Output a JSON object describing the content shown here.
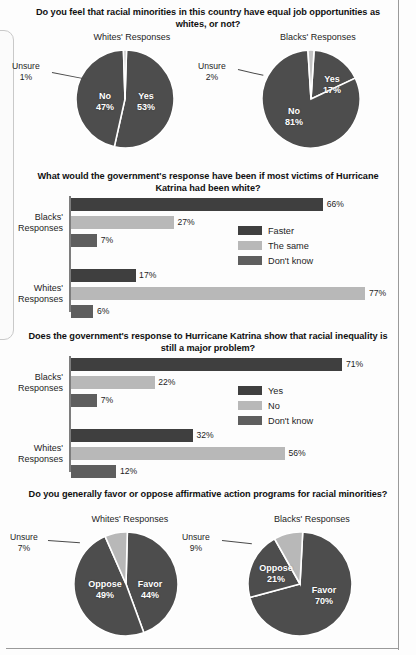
{
  "colors": {
    "dark": "#4d4d4d",
    "darker": "#3f3f3f",
    "medium": "#5e5e5e",
    "light": "#b8b8b8",
    "axis": "#7d7d7d",
    "text": "#1d1d1d",
    "white": "#ffffff"
  },
  "panels": [
    {
      "id": "job-opportunities",
      "title": "Do you feel that racial minorities in this country have equal job opportunities as whites, or not?",
      "charts": [
        {
          "group": "Whites' Responses",
          "callout": {
            "label": "Unsure",
            "value": "1%"
          },
          "slices": [
            {
              "label": "Yes",
              "value": "53%",
              "pct": 53,
              "color": "#4d4d4d"
            },
            {
              "label": "No",
              "value": "47%",
              "pct": 46,
              "color": "#4d4d4d"
            },
            {
              "label": "Unsure",
              "value": "1%",
              "pct": 1,
              "color": "#c4c4c4"
            }
          ]
        },
        {
          "group": "Blacks' Responses",
          "callout": {
            "label": "Unsure",
            "value": "2%"
          },
          "slices": [
            {
              "label": "Yes",
              "value": "17%",
              "pct": 17,
              "color": "#4d4d4d"
            },
            {
              "label": "No",
              "value": "81%",
              "pct": 81,
              "color": "#4d4d4d"
            },
            {
              "label": "Unsure",
              "value": "2%",
              "pct": 2,
              "color": "#c4c4c4"
            }
          ]
        }
      ]
    },
    {
      "id": "katrina-white-victims",
      "title": "What would the government's response have been if most victims of Hurricane Katrina had been white?",
      "legend": [
        {
          "label": "Faster",
          "color": "#3f3f3f"
        },
        {
          "label": "The same",
          "color": "#b8b8b8"
        },
        {
          "label": "Don't know",
          "color": "#5e5e5e"
        }
      ],
      "groups": [
        {
          "name": "Blacks' Responses",
          "bars": [
            {
              "series": "Faster",
              "value": 66,
              "label": "66%"
            },
            {
              "series": "The same",
              "value": 27,
              "label": "27%"
            },
            {
              "series": "Don't know",
              "value": 7,
              "label": "7%"
            }
          ]
        },
        {
          "name": "Whites' Responses",
          "bars": [
            {
              "series": "Faster",
              "value": 17,
              "label": "17%"
            },
            {
              "series": "The same",
              "value": 77,
              "label": "77%"
            },
            {
              "series": "Don't know",
              "value": 6,
              "label": "6%"
            }
          ]
        }
      ]
    },
    {
      "id": "katrina-racial-inequality",
      "title": "Does the government's response to Hurricane Katrina show that racial inequality is still a major problem?",
      "legend": [
        {
          "label": "Yes",
          "color": "#3f3f3f"
        },
        {
          "label": "No",
          "color": "#b8b8b8"
        },
        {
          "label": "Don't know",
          "color": "#5e5e5e"
        }
      ],
      "groups": [
        {
          "name": "Blacks' Responses",
          "bars": [
            {
              "series": "Yes",
              "value": 71,
              "label": "71%"
            },
            {
              "series": "No",
              "value": 22,
              "label": "22%"
            },
            {
              "series": "Don't know",
              "value": 7,
              "label": "7%"
            }
          ]
        },
        {
          "name": "Whites' Responses",
          "bars": [
            {
              "series": "Yes",
              "value": 32,
              "label": "32%"
            },
            {
              "series": "No",
              "value": 56,
              "label": "56%"
            },
            {
              "series": "Don't know",
              "value": 12,
              "label": "12%"
            }
          ]
        }
      ]
    },
    {
      "id": "affirmative-action",
      "title": "Do you generally favor or oppose affirmative action programs for racial minorities?",
      "charts": [
        {
          "group": "Whites' Responses",
          "callout": {
            "label": "Unsure",
            "value": "7%"
          },
          "slices": [
            {
              "label": "Favor",
              "value": "44%",
              "pct": 44,
              "color": "#4d4d4d"
            },
            {
              "label": "Oppose",
              "value": "49%",
              "pct": 49,
              "color": "#4d4d4d"
            },
            {
              "label": "Unsure",
              "value": "7%",
              "pct": 7,
              "color": "#b8b8b8"
            }
          ]
        },
        {
          "group": "Blacks' Responses",
          "callout": {
            "label": "Unsure",
            "value": "9%"
          },
          "slices": [
            {
              "label": "Favor",
              "value": "70%",
              "pct": 70,
              "color": "#4d4d4d"
            },
            {
              "label": "Oppose",
              "value": "21%",
              "pct": 21,
              "color": "#4d4d4d"
            },
            {
              "label": "Unsure",
              "value": "9%",
              "pct": 9,
              "color": "#b8b8b8"
            }
          ]
        }
      ]
    }
  ],
  "chart_data": [
    {
      "type": "pie",
      "title": "Do you feel that racial minorities in this country have equal job opportunities as whites, or not?",
      "subtitle": "Whites' Responses",
      "labels": [
        "Yes",
        "No",
        "Unsure"
      ],
      "values": [
        53,
        47,
        1
      ],
      "unit": "%",
      "legend_position": "none"
    },
    {
      "type": "pie",
      "title": "Do you feel that racial minorities in this country have equal job opportunities as whites, or not?",
      "subtitle": "Blacks' Responses",
      "labels": [
        "Yes",
        "No",
        "Unsure"
      ],
      "values": [
        17,
        81,
        2
      ],
      "unit": "%",
      "legend_position": "none"
    },
    {
      "type": "bar",
      "orientation": "horizontal",
      "title": "What would the government's response have been if most victims of Hurricane Katrina had been white?",
      "categories": [
        "Blacks' Responses",
        "Whites' Responses"
      ],
      "series": [
        {
          "name": "Faster",
          "values": [
            66,
            17
          ]
        },
        {
          "name": "The same",
          "values": [
            27,
            77
          ]
        },
        {
          "name": "Don't know",
          "values": [
            7,
            6
          ]
        }
      ],
      "xlabel": "",
      "ylabel": "",
      "xlim": [
        0,
        100
      ],
      "unit": "%",
      "grid": false,
      "legend_position": "middle-right"
    },
    {
      "type": "bar",
      "orientation": "horizontal",
      "title": "Does the government's response to Hurricane Katrina show that racial inequality is still a major problem?",
      "categories": [
        "Blacks' Responses",
        "Whites' Responses"
      ],
      "series": [
        {
          "name": "Yes",
          "values": [
            71,
            32
          ]
        },
        {
          "name": "No",
          "values": [
            22,
            56
          ]
        },
        {
          "name": "Don't know",
          "values": [
            7,
            12
          ]
        }
      ],
      "xlabel": "",
      "ylabel": "",
      "xlim": [
        0,
        100
      ],
      "unit": "%",
      "grid": false,
      "legend_position": "middle-right"
    },
    {
      "type": "pie",
      "title": "Do you generally favor or oppose affirmative action programs for racial minorities?",
      "subtitle": "Whites' Responses",
      "labels": [
        "Favor",
        "Oppose",
        "Unsure"
      ],
      "values": [
        44,
        49,
        7
      ],
      "unit": "%",
      "legend_position": "none"
    },
    {
      "type": "pie",
      "title": "Do you generally favor or oppose affirmative action programs for racial minorities?",
      "subtitle": "Blacks' Responses",
      "labels": [
        "Favor",
        "Oppose",
        "Unsure"
      ],
      "values": [
        70,
        21,
        9
      ],
      "unit": "%",
      "legend_position": "none"
    }
  ]
}
